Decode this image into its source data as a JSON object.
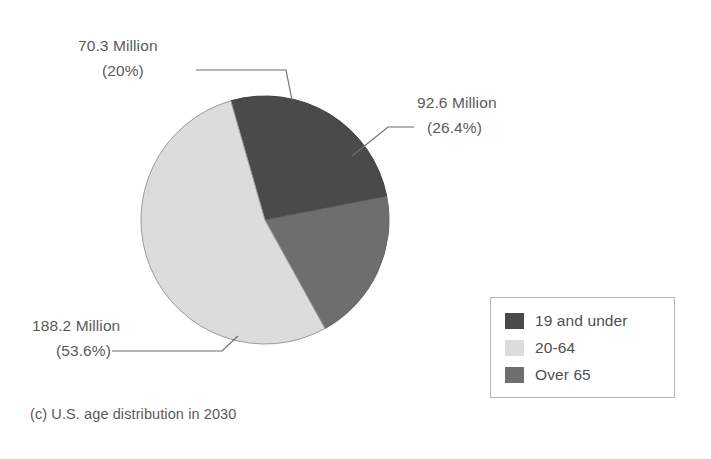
{
  "figure": {
    "caption": "(c) U.S. age distribution in 2030",
    "background": "#ffffff"
  },
  "chart_data": {
    "type": "pie",
    "title": "",
    "subtitle": "",
    "caption": "(c) U.S. age distribution in 2030",
    "unit": "Million",
    "categories": [
      "19 and under",
      "20-64",
      "Over 65"
    ],
    "values": [
      92.6,
      188.2,
      70.3
    ],
    "percentages": [
      26.4,
      53.6,
      20.0
    ],
    "colors": [
      "#4a4a4a",
      "#dcdcdc",
      "#6e6e6e"
    ],
    "labels": [
      "92.6 Million (26.4%)",
      "188.2 Million (53.6%)",
      "70.3 Million (20%)"
    ],
    "legend_position": "bottom-right",
    "grid": false,
    "start_angle_deg": -16,
    "direction": "clockwise",
    "slices": [
      {
        "name": "19 and under",
        "value": 92.6,
        "value_text": "92.6 Million",
        "percent": 26.4,
        "percent_text": "(26.4%)",
        "color": "#4a4a4a"
      },
      {
        "name": "20-64",
        "value": 188.2,
        "value_text": "188.2 Million",
        "percent": 53.6,
        "percent_text": "(53.6%)",
        "color": "#dcdcdc"
      },
      {
        "name": "Over 65",
        "value": 70.3,
        "value_text": "70.3 Million",
        "percent": 20.0,
        "percent_text": "(20%)",
        "color": "#6e6e6e"
      }
    ]
  },
  "callouts": {
    "over65": {
      "value_text": "70.3 Million",
      "percent_text": "(20%)"
    },
    "under19": {
      "value_text": "92.6 Million",
      "percent_text": "(26.4%)"
    },
    "age2064": {
      "value_text": "188.2 Million",
      "percent_text": "(53.6%)"
    }
  },
  "legend": {
    "items": [
      {
        "label": "19 and under",
        "color": "#4a4a4a"
      },
      {
        "label": "20-64",
        "color": "#dcdcdc"
      },
      {
        "label": "Over 65",
        "color": "#6e6e6e"
      }
    ],
    "border_color": "#b6b6b6"
  }
}
